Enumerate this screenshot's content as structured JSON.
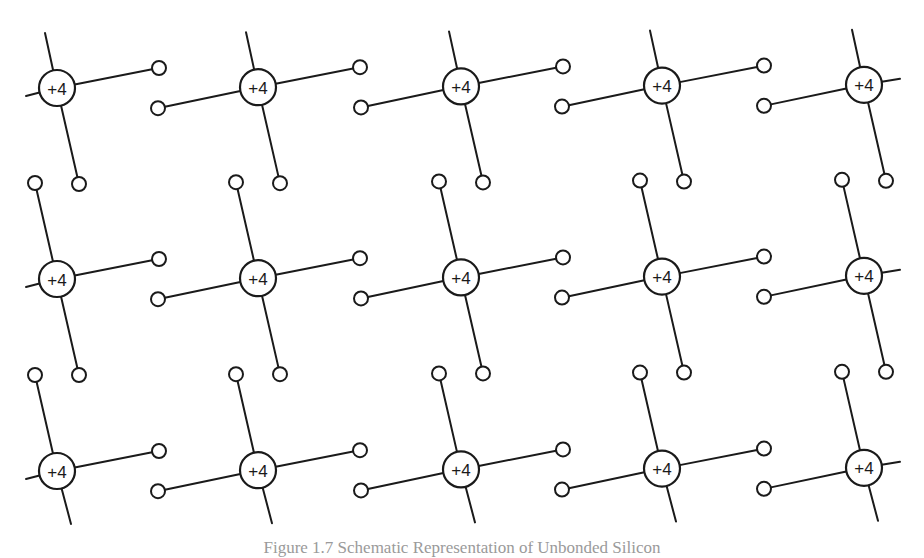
{
  "diagram": {
    "type": "crystal-lattice-schematic",
    "atom_label": "+4",
    "rows": 3,
    "columns": 5,
    "bonds_per_atom": 4,
    "colors": {
      "ink": "#1a1a1a",
      "background": "#ffffff",
      "caption": "#9a9a9a"
    },
    "atoms": [
      {
        "row": 1,
        "col": 1,
        "label": "+4"
      },
      {
        "row": 1,
        "col": 2,
        "label": "+4"
      },
      {
        "row": 1,
        "col": 3,
        "label": "+4"
      },
      {
        "row": 1,
        "col": 4,
        "label": "+4"
      },
      {
        "row": 1,
        "col": 5,
        "label": "+4"
      },
      {
        "row": 2,
        "col": 1,
        "label": "+4"
      },
      {
        "row": 2,
        "col": 2,
        "label": "+4"
      },
      {
        "row": 2,
        "col": 3,
        "label": "+4"
      },
      {
        "row": 2,
        "col": 4,
        "label": "+4"
      },
      {
        "row": 2,
        "col": 5,
        "label": "+4"
      },
      {
        "row": 3,
        "col": 1,
        "label": "+4"
      },
      {
        "row": 3,
        "col": 2,
        "label": "+4"
      },
      {
        "row": 3,
        "col": 3,
        "label": "+4"
      },
      {
        "row": 3,
        "col": 4,
        "label": "+4"
      },
      {
        "row": 3,
        "col": 5,
        "label": "+4"
      }
    ]
  },
  "caption": "Figure 1.7  Schematic Representation of Unbonded Silicon"
}
